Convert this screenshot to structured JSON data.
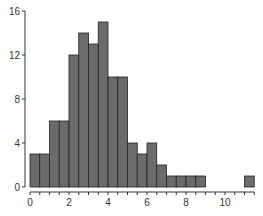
{
  "chart_data": {
    "type": "bar",
    "subtype": "histogram",
    "title": "",
    "xlabel": "",
    "ylabel": "",
    "bin_width": 0.5,
    "bin_edges": [
      0,
      0.5,
      1,
      1.5,
      2,
      2.5,
      3,
      3.5,
      4,
      4.5,
      5,
      5.5,
      6,
      6.5,
      7,
      7.5,
      8,
      8.5,
      9,
      9.5,
      10,
      10.5,
      11,
      11.5
    ],
    "values": [
      3,
      3,
      6,
      6,
      12,
      14,
      13,
      15,
      10,
      10,
      4,
      3,
      4,
      2,
      1,
      1,
      1,
      1,
      0,
      0,
      0,
      0,
      1
    ],
    "xlim": [
      0,
      11.5
    ],
    "ylim": [
      0,
      16
    ],
    "x_ticks": [
      0,
      2,
      4,
      6,
      8,
      10
    ],
    "x_minor_ticks_step": 0.5,
    "y_ticks": [
      0,
      4,
      8,
      12,
      16
    ],
    "grid": false,
    "legend": null,
    "colors": {
      "bar_fill": "#6b6b6b",
      "bar_edge": "#222222",
      "axis": "#333333"
    }
  }
}
